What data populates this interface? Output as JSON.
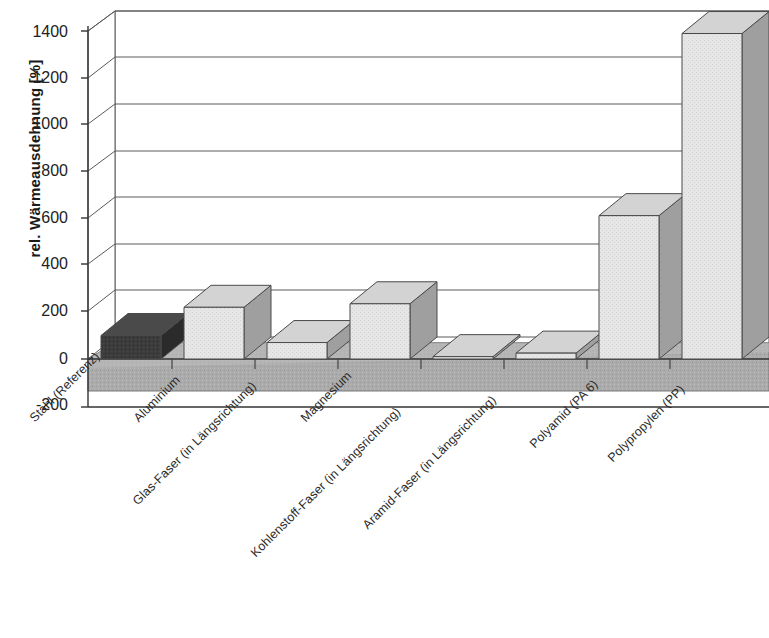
{
  "chart_data": {
    "type": "bar",
    "title": "",
    "subtitle": "",
    "xlabel": "",
    "ylabel": "rel. Wärmeausdehnung [%]",
    "ylim": [
      -200,
      1400
    ],
    "ytick_step": 200,
    "yticks": [
      "1400",
      "1200",
      "1000",
      "800",
      "600",
      "400",
      "200",
      "0",
      "-200"
    ],
    "ytick_values": [
      1400,
      1200,
      1000,
      800,
      600,
      400,
      200,
      0,
      -200
    ],
    "grid": true,
    "legend": "none",
    "three_d": true,
    "categories": [
      "Stahl (Referenz)",
      "Aluminium",
      "Glas-Faser (in Längsrichtung)",
      "Magnesium",
      "Kohlenstoff-Faser (in Längsrichtung)",
      "Aramid-Faser (in Längsrichtung)",
      "Polyamid (PA 6)",
      "Polypropylen (PP)"
    ],
    "values": [
      100,
      220,
      70,
      235,
      10,
      25,
      610,
      1385
    ],
    "bar_colors": [
      "#3a3a3a",
      "#e4e4e4",
      "#e4e4e4",
      "#e4e4e4",
      "#e4e4e4",
      "#e4e4e4",
      "#e4e4e4",
      "#e4e4e4"
    ],
    "highlight_index": 0,
    "highlight_color": "#3a3a3a",
    "bar_color": "#e4e4e4",
    "bar_outline_color": "#4a4a4a",
    "floor_color": "#a8a8a8",
    "wall_color": "#ffffff",
    "grid_color": "#595959",
    "axis_color": "#333333"
  },
  "axis": {
    "ylabel": "rel. Wärmeausdehnung [%]"
  }
}
